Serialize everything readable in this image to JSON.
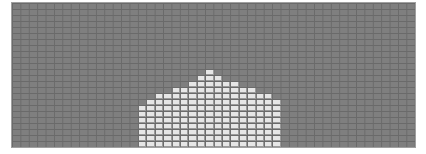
{
  "grid": {
    "cols": 48,
    "rows": 24,
    "cell_w": 8.4,
    "cell_h": 6,
    "background_color": "#7f7f7f",
    "line_color": "#6a6a6a",
    "filled_color": "#e6e6e6"
  },
  "filled_region": {
    "start_col": 15,
    "bottom_row": 23,
    "column_heights": [
      7,
      8,
      9,
      9,
      10,
      10,
      11,
      12,
      13,
      12,
      11,
      11,
      10,
      10,
      9,
      9,
      8
    ]
  }
}
